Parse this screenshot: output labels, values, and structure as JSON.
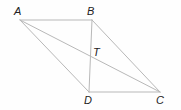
{
  "diagram": {
    "type": "parallelogram-with-diagonals",
    "line_color": "#b8b8b8",
    "label_color": "#222222",
    "points": {
      "A": {
        "label": "A",
        "x": 20,
        "y": 20
      },
      "B": {
        "label": "B",
        "x": 92,
        "y": 20
      },
      "C": {
        "label": "C",
        "x": 160,
        "y": 92
      },
      "D": {
        "label": "D",
        "x": 89,
        "y": 92
      },
      "T": {
        "label": "T"
      }
    },
    "segments": [
      [
        "A",
        "B"
      ],
      [
        "B",
        "C"
      ],
      [
        "C",
        "D"
      ],
      [
        "D",
        "A"
      ],
      [
        "A",
        "C"
      ],
      [
        "B",
        "D"
      ]
    ],
    "intersection": {
      "name": "T",
      "of": [
        [
          "A",
          "C"
        ],
        [
          "B",
          "D"
        ]
      ]
    }
  }
}
